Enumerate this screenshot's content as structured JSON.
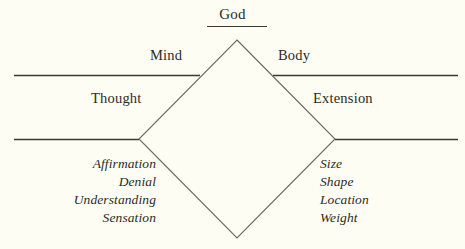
{
  "diagram": {
    "colors": {
      "background": "#fdfdf3",
      "ink": "#2b2b28",
      "rule": "#3a3a33",
      "diamond_stroke": "#6b6b60"
    },
    "apex": {
      "label": "God"
    },
    "upper_tier": {
      "left_label": "Mind",
      "right_label": "Body"
    },
    "middle_tier": {
      "left_label": "Thought",
      "right_label": "Extension"
    },
    "lower_tier": {
      "left_items": [
        "Affirmation",
        "Denial",
        "Understanding",
        "Sensation"
      ],
      "right_items": [
        "Size",
        "Shape",
        "Location",
        "Weight"
      ]
    }
  }
}
